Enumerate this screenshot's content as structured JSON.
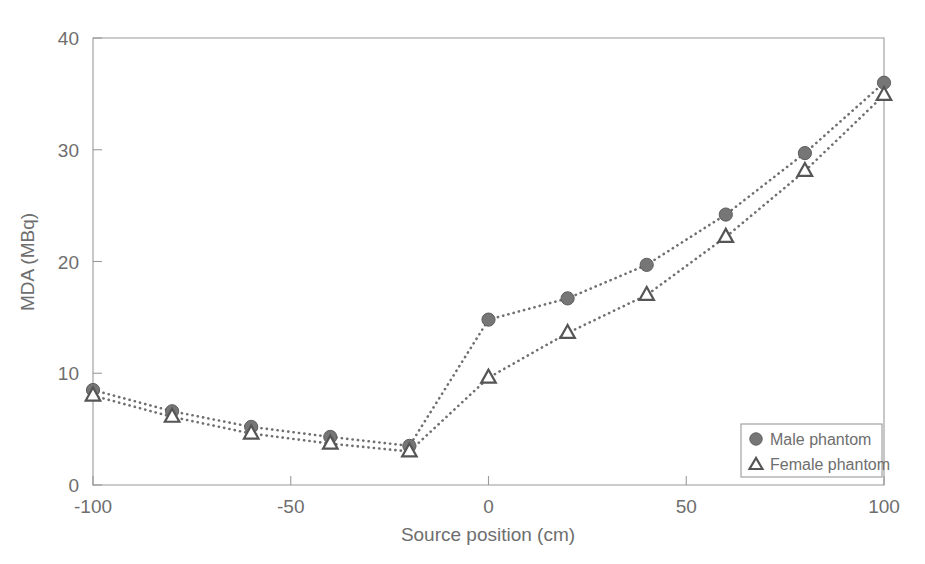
{
  "chart_data": {
    "type": "line",
    "title": "",
    "xlabel": "Source position (cm)",
    "ylabel": "MDA (MBq)",
    "xlim": [
      -100,
      100
    ],
    "ylim": [
      0,
      40
    ],
    "xticks": [
      -100,
      -50,
      0,
      50,
      100
    ],
    "xtick_labels": [
      "-100",
      "-50",
      "0",
      "50",
      "100"
    ],
    "yticks": [
      0,
      10,
      20,
      30,
      40
    ],
    "ytick_labels": [
      "0",
      "10",
      "20",
      "30",
      "40"
    ],
    "grid": false,
    "legend_position": "lower right",
    "x": [
      -100,
      -80,
      -60,
      -40,
      -20,
      0,
      20,
      40,
      60,
      80,
      100
    ],
    "series": [
      {
        "name": "Male phantom",
        "marker": "filled-circle",
        "linestyle": "dotted",
        "color": "#767676",
        "values": [
          8.5,
          6.6,
          5.2,
          4.3,
          3.5,
          14.8,
          16.7,
          19.7,
          24.2,
          29.7,
          36.0
        ]
      },
      {
        "name": "Female phantom",
        "marker": "open-triangle",
        "linestyle": "dotted",
        "color": "#555555",
        "values": [
          8.0,
          6.1,
          4.6,
          3.7,
          3.0,
          9.6,
          13.6,
          17.0,
          22.2,
          28.1,
          34.9
        ]
      }
    ]
  },
  "legend": {
    "entries": [
      {
        "label": "Male phantom",
        "marker": "filled-circle"
      },
      {
        "label": "Female phantom",
        "marker": "open-triangle"
      }
    ]
  },
  "axes": {
    "x_title": "Source position (cm)",
    "y_title": "MDA (MBq)"
  },
  "colors": {
    "axis": "#9a9a9a",
    "text": "#6e6e6e",
    "male": "#767676",
    "female": "#555555",
    "background": "#ffffff"
  }
}
